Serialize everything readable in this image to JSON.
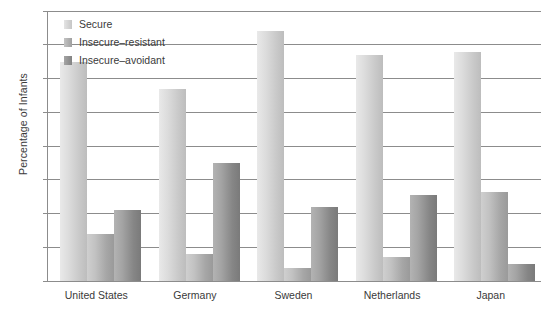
{
  "chart_data": {
    "type": "bar",
    "title": "",
    "xlabel": "",
    "ylabel": "Percentage of Infants",
    "ylim": [
      0,
      80
    ],
    "ytick_step": 10,
    "yticks": [
      0,
      10,
      20,
      30,
      40,
      50,
      60,
      70,
      80
    ],
    "grid": true,
    "legend_position": "top-left",
    "categories": [
      "United States",
      "Germany",
      "Sweden",
      "Netherlands",
      "Japan"
    ],
    "series": [
      {
        "name": "Secure",
        "color": "#d8d8d8",
        "values": [
          65,
          57,
          74,
          67,
          68
        ]
      },
      {
        "name": "Insecure–resistant",
        "color": "#ababab",
        "values": [
          14,
          8,
          4,
          7,
          26.5
        ]
      },
      {
        "name": "Insecure–avoidant",
        "color": "#8c8c8c",
        "values": [
          21,
          35,
          22,
          25.5,
          5
        ]
      }
    ]
  },
  "axis": {
    "y_title": "Percentage of Infants"
  }
}
